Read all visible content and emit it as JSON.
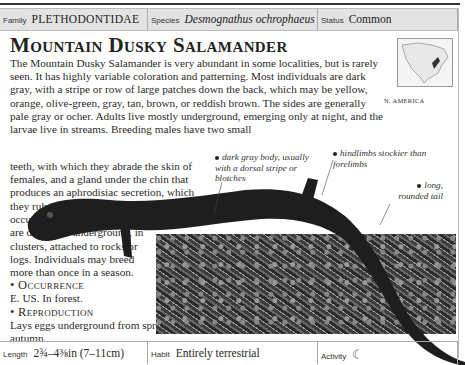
{
  "header": {
    "family_label": "Family",
    "family_value": "PLETHODONTIDAE",
    "species_label": "Species",
    "species_value": "Desmognathus ochrophaeus",
    "status_label": "Status",
    "status_value": "Common"
  },
  "title": "Mountain Dusky Salamander",
  "body": {
    "wide": "The Mountain Dusky Salamander is very abundant in some localities, but is rarely seen. It has highly variable coloration and patterning. Most individuals are dark gray, with a stripe or row of large patches down the back, which may be yellow, orange, olive-green, gray, tan, brown, or reddish brown. The sides are generally pale gray or ocher. Adults live mostly underground, emerging only at night, and the larvae live in streams. Breeding males have two small",
    "narrow1": "teeth, with which they abrade the skin of females, and a gland under the chin that produces an aphrodisiac secretion, which",
    "narrow2": "they rub into the skin. Mating occurs on land, then the eggs are deposited underground, in clusters, attached to rocks or logs. Individuals may breed more than once in a season."
  },
  "sections": [
    {
      "heading": "Occurrence",
      "text": "E. US. In forest."
    },
    {
      "heading": "Reproduction",
      "text": "Lays eggs underground from spring to autumn."
    }
  ],
  "map": {
    "label": "N. AMERICA"
  },
  "annotations": {
    "body": "dark gray body, usually with a dorsal stripe or blotches",
    "hindlimbs": "hindlimbs stockier than forelimbs",
    "tail": "long, rounded tail"
  },
  "footer": {
    "length_label": "Length",
    "length_value": "2¾–4⅜in (7–11cm)",
    "habit_label": "Habit",
    "habit_value": "Entirely terrestrial",
    "activity_label": "Activity",
    "activity_icon": "☾"
  }
}
